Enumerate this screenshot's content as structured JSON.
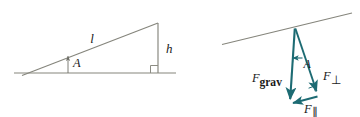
{
  "figure": {
    "background_color": "#ffffff",
    "width": 360,
    "height": 117,
    "line_color": "#7a7a72",
    "vector_color": "#1d6b73",
    "text_color": "#1a1a1a"
  },
  "left_diagram": {
    "name": "incline-geometry",
    "labels": {
      "hypotenuse": "l",
      "height": "h",
      "angle": "A"
    },
    "geometry": {
      "ground_start_x": 14,
      "ground_end_x": 176,
      "ground_y": 73,
      "apex_x": 158,
      "apex_y": 23,
      "incline_start_x": 22,
      "incline_start_y": 75,
      "right_angle_x": 158,
      "right_angle_y": 73,
      "angle_marker_x": 68,
      "angle_marker_y": 73
    }
  },
  "right_diagram": {
    "name": "force-components",
    "labels": {
      "gravity": "F",
      "gravity_sub": "grav",
      "perpendicular": "F",
      "perpendicular_sub": "⊥",
      "parallel": "F",
      "parallel_sub": "∥",
      "angle": "A"
    },
    "geometry": {
      "incline_start_x": 222,
      "incline_start_y": 44,
      "incline_end_x": 352,
      "incline_end_y": 13,
      "origin_x": 295,
      "origin_y": 28,
      "grav_tip_x": 290,
      "grav_tip_y": 103,
      "perp_tip_x": 318,
      "perp_tip_y": 95,
      "right_angle_x": 312,
      "right_angle_y": 90
    }
  }
}
